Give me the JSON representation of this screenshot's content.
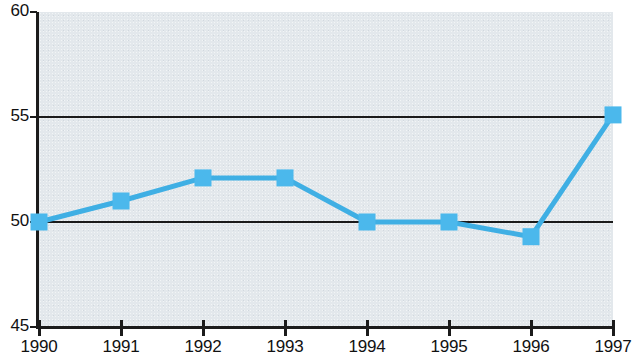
{
  "chart_data": {
    "type": "line",
    "title": "",
    "subtitle": "",
    "xlabel": "",
    "ylabel": "",
    "categories": [
      "1990",
      "1991",
      "1992",
      "1993",
      "1994",
      "1995",
      "1996",
      "1997"
    ],
    "x": [
      1990,
      1991,
      1992,
      1993,
      1994,
      1995,
      1996,
      1997
    ],
    "values": [
      50.0,
      51.0,
      52.1,
      52.1,
      50.0,
      50.0,
      49.3,
      55.1
    ],
    "series": [
      {
        "name": "",
        "values": [
          50.0,
          51.0,
          52.1,
          52.1,
          50.0,
          50.0,
          49.3,
          55.1
        ]
      }
    ],
    "ylim": [
      45,
      60
    ],
    "yticks": [
      45,
      50,
      55,
      60
    ],
    "ytick_labels": [
      "45",
      "50",
      "55",
      "60"
    ],
    "xtick_labels": [
      "1990",
      "1991",
      "1992",
      "1993",
      "1994",
      "1995",
      "1996",
      "1997"
    ],
    "gridlines_y": [
      50,
      55
    ],
    "grid": true,
    "legend": false,
    "legend_position": "none",
    "marker": "square",
    "colors": {
      "series_line": "#3FAFE4",
      "marker_fill": "#4BB8EC",
      "axis": "#1b1b1b",
      "gridline": "#1b1b1b",
      "plot_background": "#e3e8ec",
      "page_background": "#ffffff",
      "tick_label": "#111111"
    }
  }
}
